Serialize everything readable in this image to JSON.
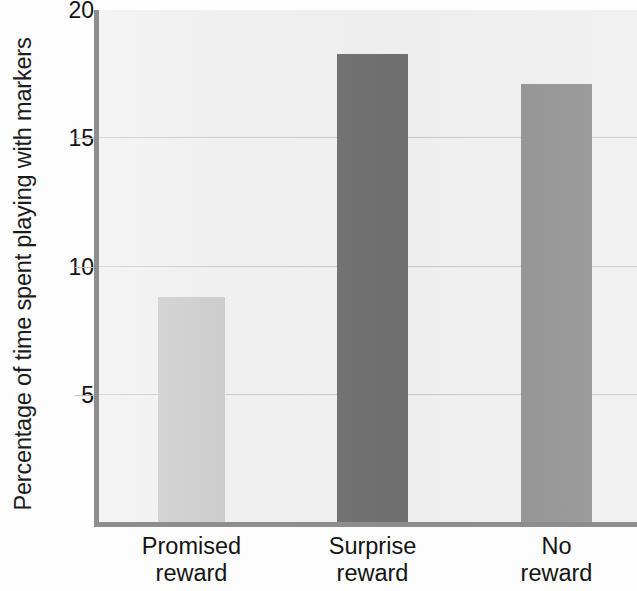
{
  "chart_data": {
    "type": "bar",
    "title": "",
    "xlabel": "",
    "ylabel": "Percentage of time spent playing with markers",
    "categories": [
      "Promised reward",
      "Surprise reward",
      "No reward"
    ],
    "category_lines": [
      [
        "Promised",
        "reward"
      ],
      [
        "Surprise",
        "reward"
      ],
      [
        "No",
        "reward"
      ]
    ],
    "values": [
      8.8,
      18.3,
      17.1
    ],
    "bar_colors": [
      "#c8c8c8",
      "#6e6e6e",
      "#8b8b8b"
    ],
    "ylim": [
      0,
      20
    ],
    "y_ticks": [
      5,
      10,
      15,
      20
    ],
    "y_tick_labels": [
      "5",
      "10",
      "15",
      "20"
    ],
    "grid": true,
    "grid_axis": "y",
    "legend": "none",
    "plot_background": "#eeeeee",
    "axis_color": "#8d8d8d",
    "gridline_color": "#c6c6c6"
  },
  "axis": {
    "y_title": "Percentage of time spent playing with markers"
  }
}
